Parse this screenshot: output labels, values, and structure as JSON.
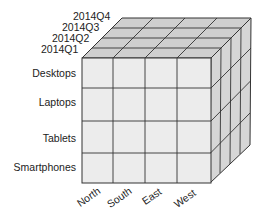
{
  "diagram": {
    "type": "data-cube",
    "dimensions": {
      "time": [
        "2014Q1",
        "2014Q2",
        "2014Q3",
        "2014Q4"
      ],
      "product": [
        "Desktops",
        "Laptops",
        "Tablets",
        "Smartphones"
      ],
      "region": [
        "North",
        "South",
        "East",
        "West"
      ]
    },
    "colors": {
      "front_face": "#ececec",
      "top_face": "#cfcfcf",
      "side_face": "#d6d6d6",
      "grid_line": "#333333"
    }
  }
}
